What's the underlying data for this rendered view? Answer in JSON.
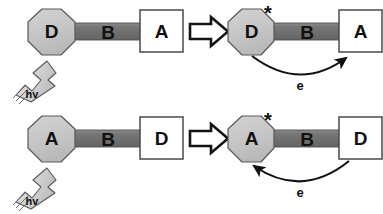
{
  "figure": {
    "type": "reaction-scheme-diagram",
    "background_color": "#ffffff",
    "colors": {
      "donor_acceptor_fill": "#c8c8c8",
      "bridge_fill": "#6e6e6e",
      "bridge_highlight": "#8c8c8c",
      "box_fill": "#ffffff",
      "outline": "#3a3a3a",
      "text": "#111111",
      "photon_arrow_fill": "#d4d4d4"
    }
  },
  "rows": [
    {
      "id": "row-top",
      "before": {
        "octagon_label": "D",
        "bridge_label": "B",
        "box_label": "A",
        "photon_label": "hv"
      },
      "transition_arrow": "block-arrow-right",
      "after": {
        "octagon_label": "D",
        "excited_marker": "*",
        "bridge_label": "B",
        "box_label": "A",
        "electron_label": "e",
        "electron_direction": "left-to-right"
      }
    },
    {
      "id": "row-bottom",
      "before": {
        "octagon_label": "A",
        "bridge_label": "B",
        "box_label": "D",
        "photon_label": "hv"
      },
      "transition_arrow": "block-arrow-right",
      "after": {
        "octagon_label": "A",
        "excited_marker": "*",
        "bridge_label": "B",
        "box_label": "D",
        "electron_label": "e",
        "electron_direction": "right-to-left"
      }
    }
  ]
}
